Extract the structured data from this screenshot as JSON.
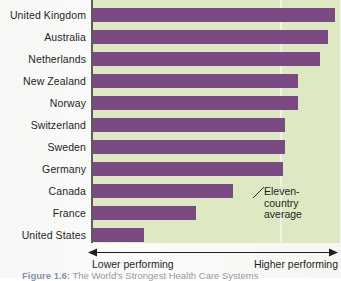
{
  "chart_data": {
    "type": "bar",
    "orientation": "horizontal",
    "title": "The World's Strongest Health Care Systems",
    "xlabel": "",
    "ylabel": "",
    "grid": false,
    "legend": "none",
    "axis_low_label": "Lower performing",
    "axis_high_label": "Higher performing",
    "annotation": "Eleven-country average",
    "annotation_lines": [
      "Eleven-",
      "country",
      "average"
    ],
    "average_value": 76,
    "xlim": [
      0,
      100
    ],
    "categories": [
      "United Kingdom",
      "Australia",
      "Netherlands",
      "New Zealand",
      "Norway",
      "Switzerland",
      "Sweden",
      "Germany",
      "Canada",
      "France",
      "United States"
    ],
    "values": [
      98,
      95,
      92,
      83,
      83,
      78,
      78,
      77,
      57,
      42,
      21
    ],
    "colors": {
      "bar": "#7b4a85",
      "plot_background": "#dde9c2",
      "average_line": "#eef3e2",
      "axis": "#5d5f57",
      "text": "#1f1f1f"
    }
  },
  "caption": {
    "number": "Figure 1.6:",
    "text": "The World's Strongest Health Care Systems"
  }
}
